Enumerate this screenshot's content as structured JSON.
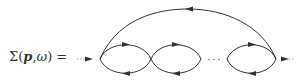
{
  "diagram": {
    "type": "feynman-diagram",
    "formula": {
      "symbol": "Σ",
      "open": "(",
      "arg1": "p",
      "sep": ",",
      "arg2": "ω",
      "close": ")",
      "equals": " ="
    },
    "ellipsis": "· · ·",
    "colors": {
      "line": "#333333",
      "dotted": "#999999",
      "text": "#333333",
      "background": "#ffffff"
    },
    "elements": [
      {
        "name": "incoming-external-line",
        "style": "dotted",
        "direction": "right"
      },
      {
        "name": "bubble-loop-1",
        "arrows": [
          "top-right",
          "bottom-left"
        ]
      },
      {
        "name": "bubble-loop-2",
        "arrows": [
          "top-right",
          "bottom-left"
        ]
      },
      {
        "name": "ellipsis"
      },
      {
        "name": "bubble-loop-n",
        "arrows": [
          "top-right",
          "bottom-left"
        ]
      },
      {
        "name": "top-arc-propagator",
        "arrow": "left"
      },
      {
        "name": "outgoing-external-line",
        "style": "dotted",
        "direction": "right"
      }
    ]
  }
}
